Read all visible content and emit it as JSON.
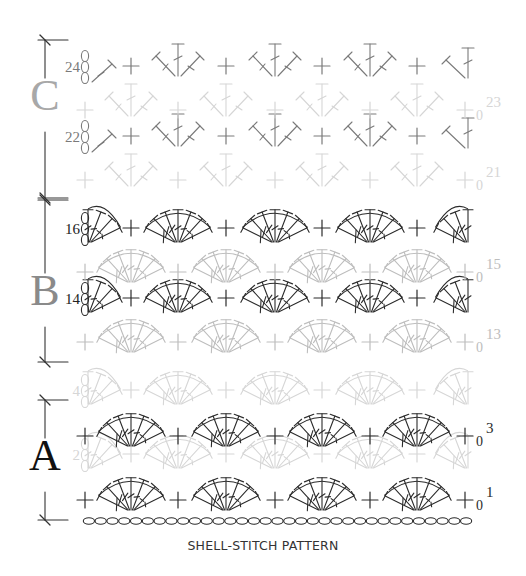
{
  "caption": "SHELL-STITCH PATTERN",
  "colors": {
    "dark": "#2b2b2b",
    "mid": "#7a7a7a",
    "light": "#bdbdbd",
    "lighter": "#d6d6d6",
    "rule": "#333333"
  },
  "sections": [
    {
      "letter": "A",
      "letter_color": "#111111",
      "top": 400,
      "bottom": 520,
      "letter_y": 470,
      "letter_size": 44
    },
    {
      "letter": "B",
      "letter_color": "#8a8a8a",
      "top": 200,
      "bottom": 362,
      "letter_y": 305,
      "letter_size": 44
    },
    {
      "letter": "C",
      "letter_color": "#a8a8a8",
      "top": 40,
      "bottom": 198,
      "letter_y": 110,
      "letter_size": 44
    }
  ],
  "foundation_chain": {
    "y": 521,
    "x_start": 83,
    "x_end": 472,
    "count": 33
  },
  "rows": [
    {
      "number": "1",
      "type": "shell-odd",
      "y": 500,
      "color": "dark",
      "label_side": "right"
    },
    {
      "number": "2",
      "type": "shell-even",
      "y": 458,
      "color": "lighter",
      "label_side": "left"
    },
    {
      "number": "3",
      "type": "shell-odd",
      "y": 436,
      "color": "dark",
      "label_side": "right"
    },
    {
      "number": "4",
      "type": "shell-even",
      "y": 394,
      "color": "lighter",
      "label_side": "left"
    },
    {
      "number": "13",
      "type": "shell-odd",
      "y": 342,
      "color": "light",
      "label_side": "right"
    },
    {
      "number": "14",
      "type": "shell-even",
      "y": 302,
      "color": "dark",
      "label_side": "left"
    },
    {
      "number": "15",
      "type": "shell-odd",
      "y": 272,
      "color": "light",
      "label_side": "right"
    },
    {
      "number": "16",
      "type": "shell-even",
      "y": 232,
      "color": "dark",
      "label_side": "left"
    },
    {
      "number": "21",
      "type": "v-odd",
      "y": 180,
      "color": "lighter",
      "label_side": "right"
    },
    {
      "number": "22",
      "type": "v-even",
      "y": 140,
      "color": "mid",
      "label_side": "left"
    },
    {
      "number": "23",
      "type": "v-odd",
      "y": 110,
      "color": "lighter",
      "label_side": "right"
    },
    {
      "number": "24",
      "type": "v-even",
      "y": 70,
      "color": "mid",
      "label_side": "left"
    }
  ],
  "grid": {
    "sc_positions_odd": [
      85,
      178,
      275,
      370
    ],
    "shell_centers_odd": [
      131,
      226,
      322,
      417
    ],
    "end_sc_x": 465,
    "sc_positions_even": [
      131,
      226,
      322,
      417
    ],
    "shell_centers_even": [
      178,
      275,
      370
    ],
    "half_left_x": 95,
    "half_right_x": 468
  },
  "legend": {
    "single_crochet_symbol": "+",
    "chain_symbol": "0"
  }
}
